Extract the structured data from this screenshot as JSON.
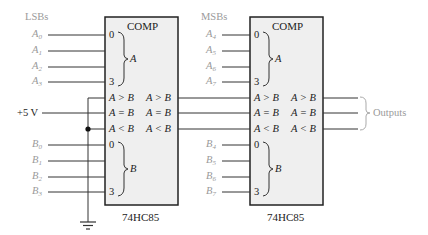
{
  "diagram": {
    "colors": {
      "wire": "#333333",
      "input_label": "#9a9a9a",
      "chip_fill": "#efefef",
      "chip_border": "#222222",
      "brace": "#aaaaaa"
    },
    "left_group_label": "LSBs",
    "right_group_label": "MSBs",
    "supply_label": "+5 V",
    "outputs_label": "Outputs",
    "chips": [
      {
        "id": "lsb",
        "title": "COMP",
        "part": "74HC85",
        "a_inputs": [
          "A0",
          "A1",
          "A2",
          "A3"
        ],
        "b_inputs": [
          "B0",
          "B1",
          "B2",
          "B3"
        ],
        "pin_first": "0",
        "pin_last": "3",
        "a_bus": "A",
        "b_bus": "B",
        "cascade_inputs": [
          "A > B",
          "A = B",
          "A < B"
        ],
        "outputs": [
          "A > B",
          "A = B",
          "A < B"
        ]
      },
      {
        "id": "msb",
        "title": "COMP",
        "part": "74HC85",
        "a_inputs": [
          "A4",
          "A5",
          "A6",
          "A7"
        ],
        "b_inputs": [
          "B4",
          "B5",
          "B6",
          "B7"
        ],
        "pin_first": "0",
        "pin_last": "3",
        "a_bus": "A",
        "b_bus": "B",
        "cascade_inputs": [
          "A > B",
          "A = B",
          "A < B"
        ],
        "outputs": [
          "A > B",
          "A = B",
          "A < B"
        ]
      }
    ],
    "input_letters": {
      "lsb_a": [
        {
          "l": "A",
          "s": "0"
        },
        {
          "l": "A",
          "s": "1"
        },
        {
          "l": "A",
          "s": "2"
        },
        {
          "l": "A",
          "s": "3"
        }
      ],
      "lsb_b": [
        {
          "l": "B",
          "s": "0"
        },
        {
          "l": "B",
          "s": "1"
        },
        {
          "l": "B",
          "s": "2"
        },
        {
          "l": "B",
          "s": "3"
        }
      ],
      "msb_a": [
        {
          "l": "A",
          "s": "4"
        },
        {
          "l": "A",
          "s": "5"
        },
        {
          "l": "A",
          "s": "6"
        },
        {
          "l": "A",
          "s": "7"
        }
      ],
      "msb_b": [
        {
          "l": "B",
          "s": "4"
        },
        {
          "l": "B",
          "s": "5"
        },
        {
          "l": "B",
          "s": "6"
        },
        {
          "l": "B",
          "s": "7"
        }
      ]
    }
  }
}
